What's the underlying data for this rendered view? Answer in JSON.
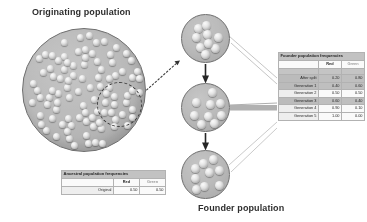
{
  "labels": {
    "originating_population": "Originating population",
    "founder_population": "Founder population"
  },
  "colors": {
    "marble_light": "#f2f2f2",
    "circle_fill": "#bdbdbd",
    "circle_stroke": "#6e6e6e",
    "table_header_fill": "#c5c5c5",
    "red_allele": "#1a1a1a",
    "green_allele": "#9d9d9d"
  },
  "ancestral_table": {
    "title": "Ancestral population frequencies",
    "columns": [
      "",
      "Red",
      "Green"
    ],
    "rows": [
      {
        "label": "Original",
        "red": "0.50",
        "green": "0.50"
      }
    ]
  },
  "founder_table": {
    "title": "Founder population frequencies",
    "columns": [
      "",
      "Red",
      "Green"
    ],
    "rows": [
      {
        "label": "After split",
        "red": "0.20",
        "green": "0.80"
      },
      {
        "label": "Generation 1",
        "red": "0.40",
        "green": "0.60"
      },
      {
        "label": "Generation 2",
        "red": "0.50",
        "green": "0.50"
      },
      {
        "label": "Generation 3",
        "red": "0.60",
        "green": "0.40"
      },
      {
        "label": "Generation 4",
        "red": "0.90",
        "green": "0.10"
      },
      {
        "label": "Generation 5",
        "red": "1.00",
        "green": "0.00"
      }
    ]
  },
  "chart_data": {
    "type": "line",
    "xlabel": "Generation",
    "ylabel": "Allele frequency",
    "ylim": [
      0,
      1
    ],
    "categories": [
      "After split",
      "Generation 1",
      "Generation 2",
      "Generation 3",
      "Generation 4",
      "Generation 5"
    ],
    "series": [
      {
        "name": "Red",
        "values": [
          0.2,
          0.4,
          0.5,
          0.6,
          0.9,
          1.0
        ]
      },
      {
        "name": "Green",
        "values": [
          0.8,
          0.6,
          0.5,
          0.4,
          0.1,
          0.0
        ]
      }
    ],
    "annotations": [
      {
        "text": "Original",
        "red": 0.5,
        "green": 0.5
      }
    ],
    "grid": false,
    "legend": "none"
  },
  "populations": {
    "originating": {
      "marble_count": 96
    },
    "generation_a": {
      "marble_count": 9
    },
    "generation_b": {
      "marble_count": 9
    },
    "generation_c": {
      "marble_count": 9
    }
  }
}
